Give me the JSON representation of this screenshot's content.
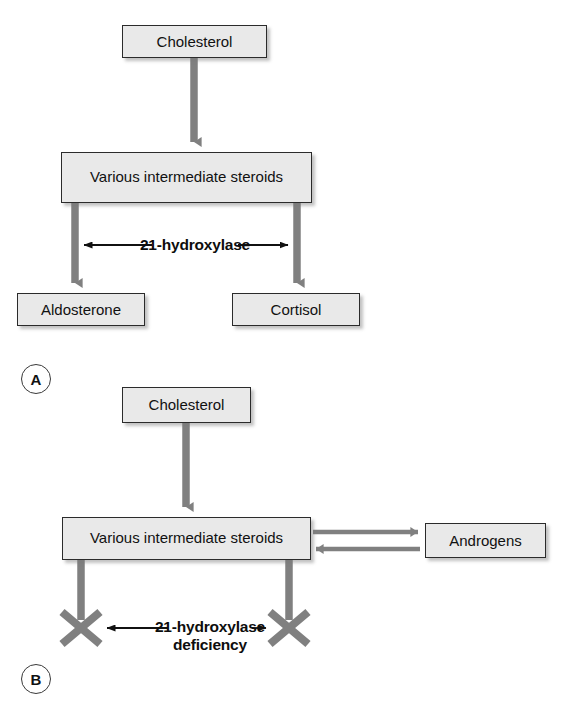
{
  "figure": {
    "background_color": "#ffffff",
    "box_fill_color": "#e9e9e9",
    "box_border_color": "#2b2b2b",
    "arrow_color": "#808080",
    "thin_arrow_color": "#111111",
    "text_color": "#111111"
  },
  "panel_a": {
    "tag": "A",
    "nodes": {
      "cholesterol": "Cholesterol",
      "intermediates": "Various intermediate\nsteroids",
      "aldosterone": "Aldosterone",
      "cortisol": "Cortisol"
    },
    "enzyme_label": "21-hydroxylase",
    "arrows": [
      {
        "name": "cholesterol-to-intermediates",
        "from": "Cholesterol",
        "to": "Various intermediate steroids",
        "direction": "down",
        "blocked": false
      },
      {
        "name": "intermediates-to-aldosterone",
        "from": "Various intermediate steroids",
        "to": "Aldosterone",
        "direction": "down",
        "blocked": false
      },
      {
        "name": "intermediates-to-cortisol",
        "from": "Various intermediate steroids",
        "to": "Cortisol",
        "direction": "down",
        "blocked": false
      }
    ]
  },
  "panel_b": {
    "tag": "B",
    "nodes": {
      "cholesterol": "Cholesterol",
      "intermediates": "Various intermediate\nsteroids",
      "androgens": "Androgens"
    },
    "enzyme_label": "21-hydroxylase\ndeficiency",
    "arrows": [
      {
        "name": "cholesterol-to-intermediates",
        "from": "Cholesterol",
        "to": "Various intermediate steroids",
        "direction": "down",
        "blocked": false
      },
      {
        "name": "intermediates-to-androgens",
        "from": "Various intermediate steroids",
        "to": "Androgens",
        "direction": "right",
        "blocked": false
      },
      {
        "name": "androgens-to-intermediates",
        "from": "Androgens",
        "to": "Various intermediate steroids",
        "direction": "left",
        "blocked": false
      },
      {
        "name": "intermediates-left-blocked",
        "from": "Various intermediate steroids",
        "to": "",
        "direction": "down",
        "blocked": true
      },
      {
        "name": "intermediates-right-blocked",
        "from": "Various intermediate steroids",
        "to": "",
        "direction": "down",
        "blocked": true
      }
    ]
  }
}
